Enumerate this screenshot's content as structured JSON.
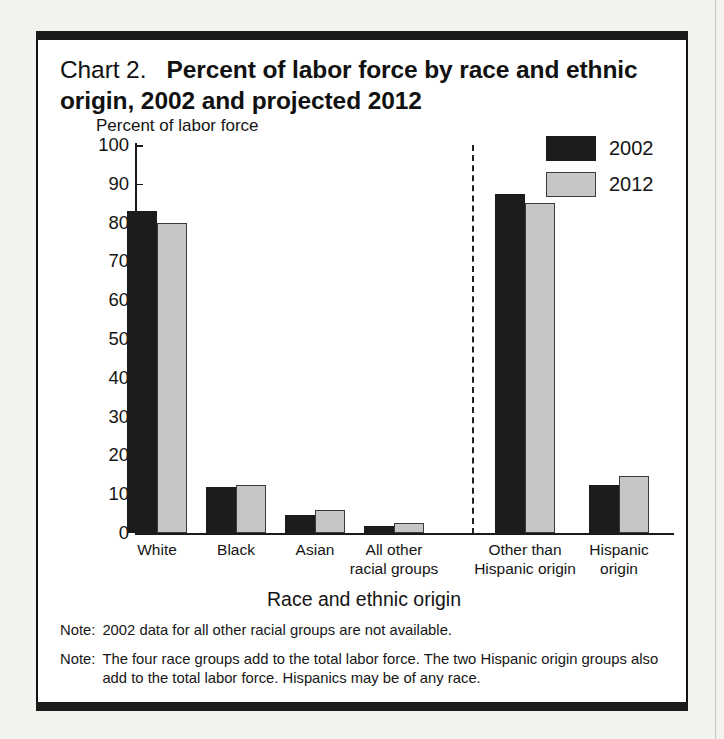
{
  "title": {
    "prefix": "Chart 2.",
    "main": "Percent of labor force by race and ethnic origin, 2002 and projected 2012"
  },
  "legend": {
    "items": [
      {
        "label": "2002",
        "color": "#1c1c1c",
        "key": "s2002"
      },
      {
        "label": "2012",
        "color": "#c6c6c6",
        "key": "s2012"
      }
    ]
  },
  "notes": [
    {
      "tag": "Note:",
      "text": "2002 data for all other racial groups are not available."
    },
    {
      "tag": "Note:",
      "text": "The four race groups add to the total labor force. The two Hispanic origin groups also add to the total labor force. Hispanics may be of any race."
    }
  ],
  "chart_data": {
    "type": "bar",
    "xlabel": "Race and ethnic origin",
    "ylabel": "Percent of labor force",
    "ylim": [
      0,
      100
    ],
    "yticks": [
      0,
      10,
      20,
      30,
      40,
      50,
      60,
      70,
      80,
      90,
      100
    ],
    "ytick_labels": [
      "0",
      "10",
      "20",
      "30",
      "40",
      "50",
      "60",
      "70",
      "80",
      "90",
      "100"
    ],
    "grid": false,
    "legend_position": "top-right",
    "categories": [
      "White",
      "Black",
      "Asian",
      "All other\nracial groups",
      "Other than\nHispanic origin",
      "Hispanic\norigin"
    ],
    "category_labels_flat": [
      "White",
      "Black",
      "Asian",
      "All other racial groups",
      "Other than Hispanic origin",
      "Hispanic origin"
    ],
    "series": [
      {
        "name": "2002",
        "color": "#1c1c1c",
        "values": [
          83.0,
          11.8,
          4.7,
          1.8,
          87.5,
          12.5
        ]
      },
      {
        "name": "2012",
        "color": "#c6c6c6",
        "values": [
          80.0,
          12.5,
          6.0,
          2.7,
          85.0,
          14.7
        ]
      }
    ],
    "annotations": [
      {
        "type": "vertical-dashed-divider",
        "after_category_index": 3
      }
    ]
  }
}
